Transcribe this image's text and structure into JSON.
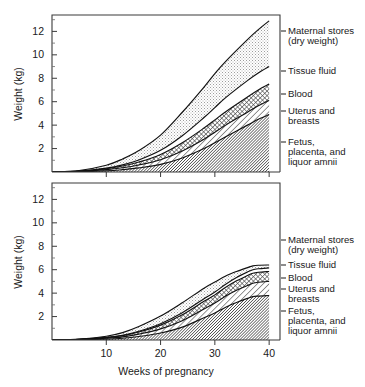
{
  "figure": {
    "title": "",
    "background": "#ffffff",
    "ink_color": "#1a1a1a"
  },
  "axis": {
    "x_title": "Weeks of pregnancy",
    "y_title": "Weight (kg)",
    "x_ticks": [
      "10",
      "20",
      "30",
      "40"
    ],
    "x_tick_values": [
      10,
      20,
      30,
      40
    ],
    "y_ticks": [
      "2",
      "4",
      "6",
      "8",
      "10",
      "12"
    ],
    "y_tick_values": [
      2,
      4,
      6,
      8,
      10,
      12
    ],
    "x_range": [
      0,
      42
    ],
    "y_range": [
      0,
      13.4
    ],
    "grid": false
  },
  "legend": {
    "position": "right-of-plot",
    "entries": [
      {
        "label_line1": "Maternal stores",
        "label_line2": "(dry weight)",
        "pattern": "light-stipple",
        "color": "#d4d4d4"
      },
      {
        "label_line1": "Tissue fluid",
        "label_line2": "",
        "pattern": "blank-white",
        "color": "#ffffff"
      },
      {
        "label_line1": "Blood",
        "label_line2": "",
        "pattern": "cross-hatch",
        "color": "#9a9a9a"
      },
      {
        "label_line1": "Uterus and",
        "label_line2": "breasts",
        "pattern": "diagonal-hatch",
        "color": "#ffffff"
      },
      {
        "label_line1": "Fetus,",
        "label_line2": "placenta, and",
        "label_line3": "liquor amnii",
        "pattern": "dense-diagonal-hatch",
        "color": "#6e6e6e"
      }
    ]
  },
  "charts": {
    "top": {
      "name": "cumulative-weight-gain-total",
      "y_label": "Weight (kg)",
      "peak_total_kg": 12.9
    },
    "bottom": {
      "name": "cumulative-weight-gain-components",
      "y_label": "Weight (kg)",
      "peak_total_kg": 6.5
    }
  },
  "chart_data": [
    {
      "type": "area",
      "name": "top-chart",
      "title": "",
      "xlabel": "",
      "ylabel": "Weight (kg)",
      "xlim": [
        0,
        42
      ],
      "ylim": [
        0,
        13.4
      ],
      "grid": false,
      "stacked": true,
      "x": [
        0,
        5,
        10,
        13,
        16,
        20,
        24,
        28,
        30,
        32,
        36,
        38,
        40
      ],
      "series": [
        {
          "name": "Fetus, placenta, and liquor amnii",
          "pattern": "dense-diagonal-hatch",
          "values": [
            0,
            0.02,
            0.1,
            0.2,
            0.35,
            0.65,
            1.2,
            2.0,
            2.5,
            3.0,
            4.0,
            4.5,
            4.9
          ]
        },
        {
          "name": "Uterus and breasts",
          "pattern": "diagonal-hatch",
          "values": [
            0,
            0.03,
            0.1,
            0.16,
            0.25,
            0.4,
            0.6,
            0.8,
            0.9,
            1.0,
            1.1,
            1.15,
            1.2
          ]
        },
        {
          "name": "Blood",
          "pattern": "cross-hatch",
          "values": [
            0,
            0.02,
            0.08,
            0.15,
            0.25,
            0.45,
            0.7,
            0.95,
            1.05,
            1.15,
            1.3,
            1.35,
            1.4
          ]
        },
        {
          "name": "Tissue fluid",
          "pattern": "blank-white",
          "values": [
            0,
            0.01,
            0.05,
            0.1,
            0.18,
            0.35,
            0.6,
            0.9,
            1.05,
            1.2,
            1.4,
            1.45,
            1.5
          ]
        },
        {
          "name": "Maternal stores (dry weight)",
          "pattern": "light-stipple",
          "values": [
            0,
            0.05,
            0.25,
            0.5,
            0.8,
            1.3,
            2.0,
            2.6,
            2.9,
            3.1,
            3.5,
            3.7,
            3.9
          ]
        }
      ],
      "totals": [
        0,
        0.13,
        0.58,
        1.11,
        1.83,
        3.15,
        5.1,
        7.25,
        8.4,
        9.45,
        11.3,
        12.15,
        12.9
      ]
    },
    {
      "type": "area",
      "name": "bottom-chart",
      "title": "",
      "xlabel": "Weeks of pregnancy",
      "ylabel": "Weight (kg)",
      "xlim": [
        0,
        42
      ],
      "ylim": [
        0,
        13.4
      ],
      "grid": false,
      "stacked": true,
      "x": [
        0,
        5,
        10,
        13,
        16,
        20,
        24,
        28,
        30,
        32,
        34,
        36,
        37,
        38,
        40
      ],
      "series": [
        {
          "name": "Fetus, placenta, and liquor amnii",
          "pattern": "dense-diagonal-hatch",
          "values": [
            0,
            0.02,
            0.08,
            0.15,
            0.3,
            0.6,
            1.1,
            1.9,
            2.3,
            2.8,
            3.2,
            3.55,
            3.7,
            3.75,
            3.8
          ]
        },
        {
          "name": "Uterus and breasts",
          "pattern": "diagonal-hatch",
          "values": [
            0,
            0.02,
            0.07,
            0.12,
            0.2,
            0.35,
            0.55,
            0.75,
            0.85,
            0.95,
            1.05,
            1.1,
            1.15,
            1.18,
            1.2
          ]
        },
        {
          "name": "Blood",
          "pattern": "cross-hatch",
          "values": [
            0,
            0.01,
            0.05,
            0.1,
            0.18,
            0.32,
            0.5,
            0.65,
            0.7,
            0.75,
            0.8,
            0.85,
            0.85,
            0.85,
            0.85
          ]
        },
        {
          "name": "Tissue fluid",
          "pattern": "blank-white",
          "values": [
            0,
            0.005,
            0.02,
            0.04,
            0.07,
            0.12,
            0.18,
            0.22,
            0.24,
            0.26,
            0.28,
            0.3,
            0.3,
            0.3,
            0.3
          ]
        },
        {
          "name": "Maternal stores (dry weight)",
          "pattern": "light-stipple",
          "values": [
            0,
            0.02,
            0.1,
            0.22,
            0.4,
            0.65,
            0.85,
            0.9,
            0.85,
            0.7,
            0.52,
            0.38,
            0.33,
            0.3,
            0.25
          ]
        }
      ],
      "totals": [
        0,
        0.075,
        0.32,
        0.63,
        1.15,
        2.04,
        3.18,
        4.42,
        4.94,
        5.46,
        5.85,
        6.18,
        6.33,
        6.38,
        6.4
      ]
    }
  ]
}
